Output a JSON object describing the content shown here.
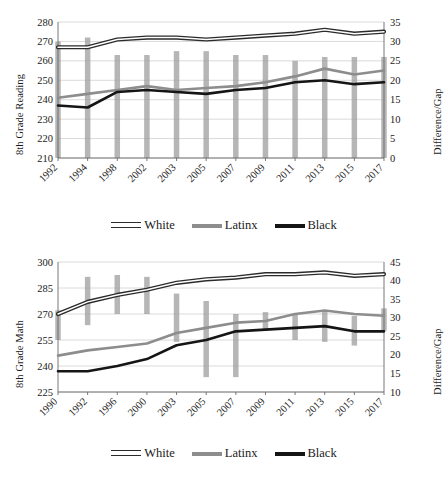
{
  "figures": [
    {
      "id": "reading",
      "chart_data": {
        "type": "line",
        "title": "",
        "xlabel": "",
        "ylabel": "8th Grade Reading",
        "y2label": "Difference/Gap",
        "ylim": [
          210,
          280
        ],
        "ytick_step": 10,
        "yticks": [
          210,
          220,
          230,
          240,
          250,
          260,
          270,
          280
        ],
        "y2lim": [
          0,
          35
        ],
        "y2ticks": [
          0,
          5,
          10,
          15,
          20,
          25,
          30,
          35
        ],
        "grid": true,
        "legend_position": "bottom",
        "categories": [
          "1992",
          "1994",
          "1998",
          "2002",
          "2003",
          "2005",
          "2007",
          "2009",
          "2011",
          "2013",
          "2015",
          "2017"
        ],
        "series": [
          {
            "name": "White",
            "color": "#2b2b2b",
            "style": "outline",
            "values": [
              267,
              267,
              271,
              272,
              272,
              271,
              272,
              273,
              274,
              276,
              274,
              275
            ]
          },
          {
            "name": "Latinx",
            "color": "#8d8d8d",
            "style": "solid",
            "values": [
              241,
              243,
              245,
              247,
              245,
              246,
              247,
              249,
              252,
              256,
              253,
              255
            ]
          },
          {
            "name": "Black",
            "color": "#151515",
            "style": "solid",
            "values": [
              237,
              236,
              244,
              245,
              244,
              243,
              245,
              246,
              249,
              250,
              248,
              249
            ]
          }
        ],
        "gap_bars": [
          {
            "category": "1992",
            "top": 30,
            "bottom": 0
          },
          {
            "category": "1994",
            "top": 31,
            "bottom": 0
          },
          {
            "category": "1998",
            "top": 26.5,
            "bottom": 0
          },
          {
            "category": "2002",
            "top": 26.5,
            "bottom": 0
          },
          {
            "category": "2003",
            "top": 27.5,
            "bottom": 0
          },
          {
            "category": "2005",
            "top": 27.5,
            "bottom": 0
          },
          {
            "category": "2007",
            "top": 26.5,
            "bottom": 0
          },
          {
            "category": "2009",
            "top": 26.5,
            "bottom": 0
          },
          {
            "category": "2011",
            "top": 25,
            "bottom": 0
          },
          {
            "category": "2013",
            "top": 26,
            "bottom": 0
          },
          {
            "category": "2015",
            "top": 26,
            "bottom": 0
          },
          {
            "category": "2017",
            "top": 26,
            "bottom": 0
          }
        ]
      },
      "legend": [
        {
          "label": "White",
          "swatch": "swatch-white"
        },
        {
          "label": "Latinx",
          "swatch": "swatch-latinx"
        },
        {
          "label": "Black",
          "swatch": "swatch-black"
        }
      ]
    },
    {
      "id": "math",
      "chart_data": {
        "type": "line",
        "title": "",
        "xlabel": "",
        "ylabel": "8th Grade Math",
        "y2label": "Difference/Gap",
        "ylim": [
          225,
          300
        ],
        "ytick_step": 15,
        "yticks": [
          225,
          240,
          255,
          270,
          285,
          300
        ],
        "y2lim": [
          10,
          45
        ],
        "y2ticks": [
          10,
          15,
          20,
          25,
          30,
          35,
          40,
          45
        ],
        "grid": true,
        "legend_position": "bottom",
        "categories": [
          "1990",
          "1992",
          "1996",
          "2000",
          "2003",
          "2005",
          "2007",
          "2009",
          "2011",
          "2013",
          "2015",
          "2017"
        ],
        "series": [
          {
            "name": "White",
            "color": "#2b2b2b",
            "style": "outline",
            "values": [
              270,
              277,
              281,
              284,
              288,
              290,
              291,
              293,
              293,
              294,
              292,
              293
            ]
          },
          {
            "name": "Latinx",
            "color": "#8d8d8d",
            "style": "solid",
            "values": [
              246,
              249,
              251,
              253,
              259,
              262,
              265,
              266,
              270,
              272,
              270,
              269
            ]
          },
          {
            "name": "Black",
            "color": "#151515",
            "style": "solid",
            "values": [
              237,
              237,
              240,
              244,
              252,
              255,
              260,
              261,
              262,
              263,
              260,
              260
            ]
          },
          {
            "name": "gap-reference",
            "color": "#8d8d8d",
            "style": "hidden",
            "values": []
          }
        ],
        "gap_bars": [
          {
            "category": "1990",
            "top": 32,
            "bottom": 24
          },
          {
            "category": "1992",
            "top": 41,
            "bottom": 28
          },
          {
            "category": "1996",
            "top": 41.5,
            "bottom": 31
          },
          {
            "category": "2000",
            "top": 41,
            "bottom": 31
          },
          {
            "category": "2003",
            "top": 36.5,
            "bottom": 23.5
          },
          {
            "category": "2005",
            "top": 34.5,
            "bottom": 14
          },
          {
            "category": "2007",
            "top": 31,
            "bottom": 14
          },
          {
            "category": "2009",
            "top": 31.5,
            "bottom": 26.5
          },
          {
            "category": "2011",
            "top": 31,
            "bottom": 24
          },
          {
            "category": "2013",
            "top": 32,
            "bottom": 23.5
          },
          {
            "category": "2015",
            "top": 30.5,
            "bottom": 22.5
          },
          {
            "category": "2017",
            "top": 32.5,
            "bottom": 26.5
          }
        ]
      },
      "legend": [
        {
          "label": "White",
          "swatch": "swatch-white"
        },
        {
          "label": "Latinx",
          "swatch": "swatch-latinx"
        },
        {
          "label": "Black",
          "swatch": "swatch-black"
        }
      ]
    }
  ],
  "colors": {
    "white_series": "#2b2b2b",
    "latinx_series": "#8d8d8d",
    "black_series": "#151515",
    "gap_bar": "#9a9a9a",
    "grid": "#d0d0d0",
    "text": "#1a1a1a"
  }
}
